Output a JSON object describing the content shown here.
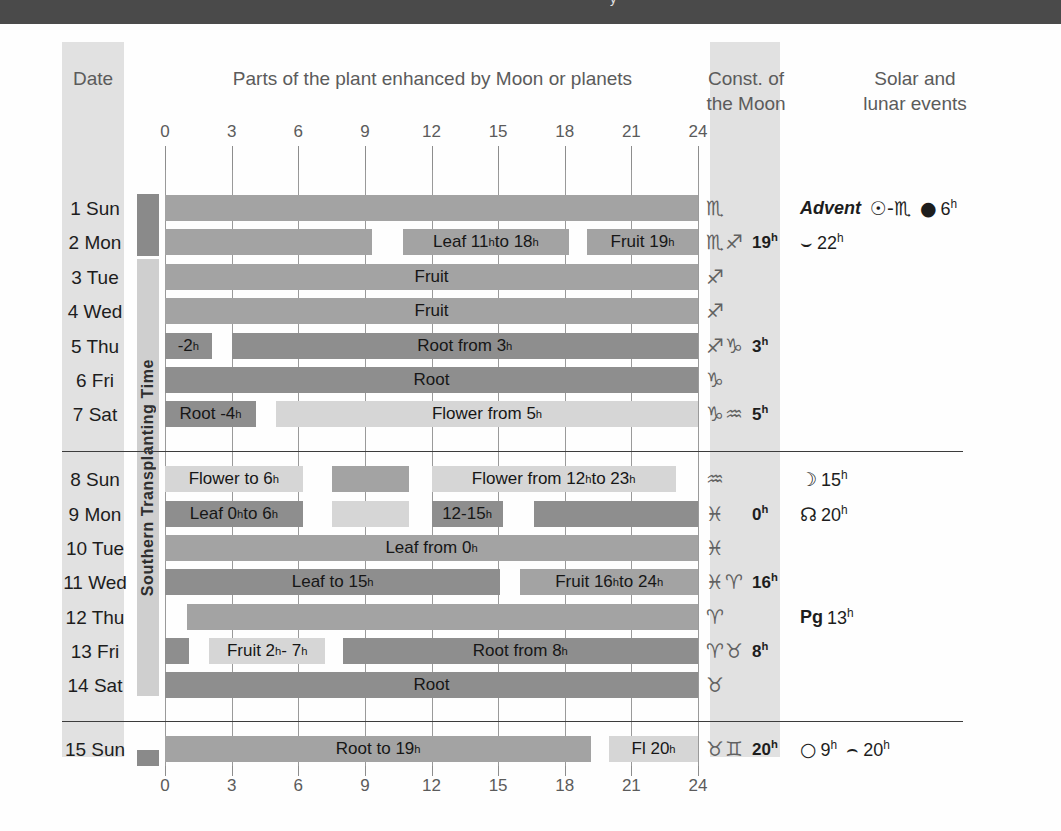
{
  "topbar": {
    "clipped_text": "y"
  },
  "headers": {
    "date": "Date",
    "parts": "Parts of the plant enhanced by Moon or planets",
    "constellation": "Const. of\nthe Moon",
    "events": "Solar and\nlunar events"
  },
  "side_band": {
    "label": "Southern Transplanting Time"
  },
  "axis": {
    "ticks": [
      0,
      3,
      6,
      9,
      12,
      15,
      18,
      21,
      24
    ],
    "min": 0,
    "max": 24,
    "unit": "hour"
  },
  "colors": {
    "dark_bar": "#8e8e8e",
    "medium_bar": "#a3a3a3",
    "light_bar": "#d6d6d6",
    "column_tint": "#dcdcdc",
    "topbar": "#4a4a4a",
    "separator": "#3c3c3c"
  },
  "chart_data": {
    "type": "bar",
    "title": "Parts of the plant enhanced by Moon or planets",
    "xlabel": "hour of day",
    "ylabel": "date",
    "xlim": [
      0,
      24
    ],
    "grid": true,
    "categories": [
      "1 Sun",
      "2 Mon",
      "3 Tue",
      "4 Wed",
      "5 Thu",
      "6 Fri",
      "7 Sat",
      "8 Sun",
      "9 Mon",
      "10 Tue",
      "11 Wed",
      "12 Thu",
      "13 Fri",
      "14 Sat",
      "15 Sun"
    ],
    "rows": [
      {
        "date": "1 Sun",
        "segments": [
          {
            "start": 0,
            "end": 24,
            "tone": "medium",
            "label": ""
          }
        ]
      },
      {
        "date": "2 Mon",
        "segments": [
          {
            "start": 0,
            "end": 9.3,
            "tone": "medium",
            "label": ""
          },
          {
            "start": 10.7,
            "end": 18.2,
            "tone": "medium",
            "label": "Leaf 11h to 18h"
          },
          {
            "start": 19,
            "end": 24,
            "tone": "medium",
            "label": "Fruit 19h"
          }
        ]
      },
      {
        "date": "3 Tue",
        "segments": [
          {
            "start": 0,
            "end": 24,
            "tone": "medium",
            "label": "Fruit"
          }
        ]
      },
      {
        "date": "4 Wed",
        "segments": [
          {
            "start": 0,
            "end": 24,
            "tone": "medium",
            "label": "Fruit"
          }
        ]
      },
      {
        "date": "5 Thu",
        "segments": [
          {
            "start": 0,
            "end": 2.1,
            "tone": "dark",
            "label": "-2h"
          },
          {
            "start": 3,
            "end": 24,
            "tone": "dark",
            "label": "Root from 3h"
          }
        ]
      },
      {
        "date": "6 Fri",
        "segments": [
          {
            "start": 0,
            "end": 24,
            "tone": "dark",
            "label": "Root"
          }
        ]
      },
      {
        "date": "7 Sat",
        "segments": [
          {
            "start": 0,
            "end": 4.1,
            "tone": "dark",
            "label": "Root -4h"
          },
          {
            "start": 5,
            "end": 24,
            "tone": "light",
            "label": "Flower from 5h"
          }
        ]
      },
      {
        "date": "8 Sun",
        "segments": [
          {
            "start": 0,
            "end": 6.2,
            "tone": "light",
            "label": "Flower to 6h"
          },
          {
            "start": 7.5,
            "end": 11,
            "tone": "medium",
            "label": ""
          },
          {
            "start": 12,
            "end": 23,
            "tone": "light",
            "label": "Flower from 12h to 23h"
          }
        ]
      },
      {
        "date": "9 Mon",
        "segments": [
          {
            "start": 0,
            "end": 6.2,
            "tone": "dark",
            "label": "Leaf 0h to 6h"
          },
          {
            "start": 7.5,
            "end": 11,
            "tone": "light",
            "label": ""
          },
          {
            "start": 12,
            "end": 15.2,
            "tone": "dark",
            "label": "12-15h"
          },
          {
            "start": 16.6,
            "end": 24,
            "tone": "dark",
            "label": ""
          }
        ]
      },
      {
        "date": "10 Tue",
        "segments": [
          {
            "start": 0,
            "end": 24,
            "tone": "medium",
            "label": "Leaf from 0h"
          }
        ]
      },
      {
        "date": "11 Wed",
        "segments": [
          {
            "start": 0,
            "end": 15.1,
            "tone": "dark",
            "label": "Leaf to 15h"
          },
          {
            "start": 16,
            "end": 24,
            "tone": "medium",
            "label": "Fruit 16h to 24h"
          }
        ]
      },
      {
        "date": "12 Thu",
        "segments": [
          {
            "start": 1,
            "end": 24,
            "tone": "medium",
            "label": ""
          }
        ]
      },
      {
        "date": "13 Fri",
        "segments": [
          {
            "start": 0,
            "end": 1.1,
            "tone": "dark",
            "label": ""
          },
          {
            "start": 2,
            "end": 7.2,
            "tone": "light",
            "label": "Fruit 2h - 7h"
          },
          {
            "start": 8,
            "end": 24,
            "tone": "dark",
            "label": "Root from 8h"
          }
        ]
      },
      {
        "date": "14 Sat",
        "segments": [
          {
            "start": 0,
            "end": 24,
            "tone": "dark",
            "label": "Root"
          }
        ]
      },
      {
        "date": "15 Sun",
        "segments": [
          {
            "start": 0,
            "end": 19.2,
            "tone": "medium",
            "label": "Root to 19h"
          },
          {
            "start": 20,
            "end": 24,
            "tone": "light",
            "label": "Fl 20h"
          }
        ]
      }
    ]
  },
  "rows": [
    {
      "date": "1 Sun",
      "const_symbols": "♏",
      "const_hour": "",
      "events": [
        {
          "type": "text",
          "glyph": "",
          "label": "Advent",
          "style": "advent"
        },
        {
          "type": "sun-enters-scorpio",
          "glyph": "☉-♏",
          "label": ""
        },
        {
          "type": "new-moon",
          "glyph": "●",
          "label": "6h"
        }
      ]
    },
    {
      "date": "2 Mon",
      "const_symbols": "♏♐",
      "const_hour": "19h",
      "events": [
        {
          "type": "perigee",
          "glyph": "⌣",
          "label": "22h"
        }
      ]
    },
    {
      "date": "3 Tue",
      "const_symbols": "♐",
      "const_hour": "",
      "events": []
    },
    {
      "date": "4 Wed",
      "const_symbols": "♐",
      "const_hour": "",
      "events": []
    },
    {
      "date": "5 Thu",
      "const_symbols": "♐♑",
      "const_hour": "3h",
      "events": []
    },
    {
      "date": "6 Fri",
      "const_symbols": "♑",
      "const_hour": "",
      "events": []
    },
    {
      "date": "7 Sat",
      "const_symbols": "♑♒",
      "const_hour": "5h",
      "events": []
    },
    {
      "date": "8 Sun",
      "const_symbols": "♒",
      "const_hour": "",
      "events": [
        {
          "type": "first-quarter-moon",
          "glyph": "☽",
          "label": "15h"
        }
      ]
    },
    {
      "date": "9 Mon",
      "const_symbols": "♓",
      "const_hour": "0h",
      "events": [
        {
          "type": "ascending-node",
          "glyph": "☊",
          "label": "20h"
        }
      ]
    },
    {
      "date": "10 Tue",
      "const_symbols": "♓",
      "const_hour": "",
      "events": []
    },
    {
      "date": "11 Wed",
      "const_symbols": "♓♈",
      "const_hour": "16h",
      "events": []
    },
    {
      "date": "12 Thu",
      "const_symbols": "♈",
      "const_hour": "",
      "events": [
        {
          "type": "perigee-label",
          "glyph": "Pg",
          "label": "13h",
          "style": "pg"
        }
      ]
    },
    {
      "date": "13 Fri",
      "const_symbols": "♈♉",
      "const_hour": "8h",
      "events": []
    },
    {
      "date": "14 Sat",
      "const_symbols": "♉",
      "const_hour": "",
      "events": []
    },
    {
      "date": "15 Sun",
      "const_symbols": "♉♊",
      "const_hour": "20h",
      "events": [
        {
          "type": "full-moon",
          "glyph": "○",
          "label": "9h"
        },
        {
          "type": "apogee",
          "glyph": "⌢",
          "label": "20h"
        }
      ]
    }
  ]
}
